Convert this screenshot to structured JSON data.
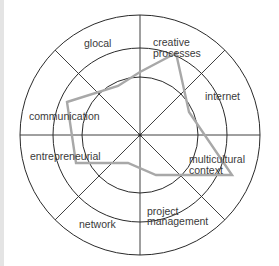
{
  "diagram": {
    "type": "radar",
    "center": [
      140,
      135
    ],
    "rings": [
      58,
      87,
      120
    ],
    "colors": {
      "grid": "#2a2a2a",
      "profile": "#a8a8a8",
      "text": "#3a3a3a",
      "strip": "#e4e4e4"
    },
    "labels": [
      {
        "id": "glocal",
        "lines": [
          "glocal"
        ]
      },
      {
        "id": "creative-processes",
        "lines": [
          "creative",
          "processes"
        ]
      },
      {
        "id": "internet",
        "lines": [
          "internet"
        ]
      },
      {
        "id": "multicultural-context",
        "lines": [
          "multicultural",
          "context"
        ]
      },
      {
        "id": "project-management",
        "lines": [
          "project",
          "management"
        ]
      },
      {
        "id": "network",
        "lines": [
          "network"
        ]
      },
      {
        "id": "entrepreneurial",
        "lines": [
          "entrepreneurial"
        ]
      },
      {
        "id": "communication",
        "lines": [
          "communication"
        ]
      }
    ],
    "profile_points": [
      [
        67,
        102
      ],
      [
        118,
        86
      ],
      [
        140,
        72
      ],
      [
        176,
        53
      ],
      [
        189,
        112
      ],
      [
        232,
        175
      ],
      [
        156,
        175
      ],
      [
        128,
        163
      ],
      [
        76,
        163
      ]
    ]
  }
}
